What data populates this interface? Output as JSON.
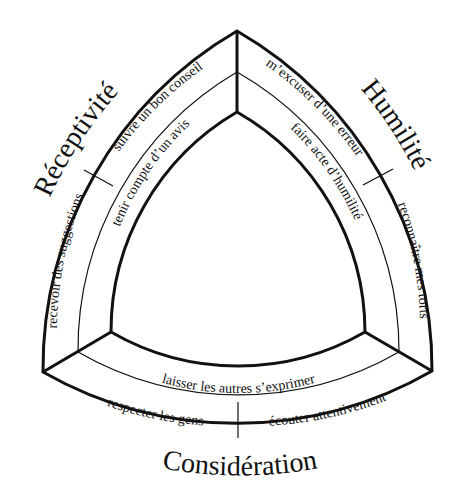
{
  "diagram": {
    "type": "reuleaux-triangle",
    "categories": [
      {
        "id": "receptivite",
        "label": "Réceptivité",
        "outer_items": [
          "suivre un bon conseil",
          "recevoir des suggestions"
        ],
        "inner_item": "tenir compte d’un avis"
      },
      {
        "id": "humilite",
        "label": "Humilité",
        "outer_items": [
          "m’excuser d’une erreur",
          "reconnaître mes torts"
        ],
        "inner_item": "faire acte d’humilité"
      },
      {
        "id": "consideration",
        "label": "Considération",
        "outer_items": [
          "respecter les gens",
          "écouter attentivement"
        ],
        "inner_item": "laisser les autres s’exprimer"
      }
    ],
    "colors": {
      "line": "#111111",
      "background": "#ffffff"
    }
  }
}
